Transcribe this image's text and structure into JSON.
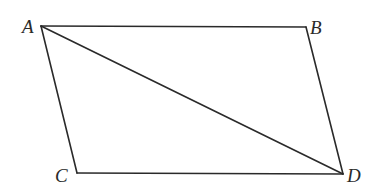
{
  "diagram": {
    "type": "parallelogram-with-diagonal",
    "vertices": {
      "A": {
        "label": "A",
        "x": 41,
        "y": 26
      },
      "B": {
        "label": "B",
        "x": 306,
        "y": 27
      },
      "C": {
        "label": "C",
        "x": 77,
        "y": 173
      },
      "D": {
        "label": "D",
        "x": 343,
        "y": 174
      }
    },
    "edges": [
      {
        "from": "A",
        "to": "B"
      },
      {
        "from": "B",
        "to": "D"
      },
      {
        "from": "D",
        "to": "C"
      },
      {
        "from": "C",
        "to": "A"
      },
      {
        "from": "A",
        "to": "D",
        "kind": "diagonal"
      }
    ],
    "labels": {
      "A": "A",
      "B": "B",
      "C": "C",
      "D": "D"
    },
    "colors": {
      "stroke": "#2a2a2a",
      "background": "#ffffff"
    }
  }
}
